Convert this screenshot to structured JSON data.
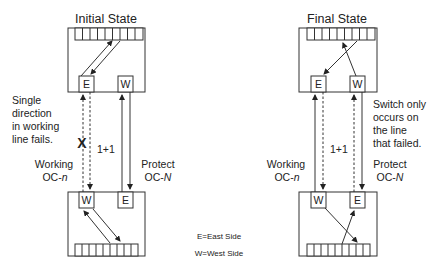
{
  "diagram": {
    "left": {
      "title": "Initial State",
      "top_node": {
        "east_label": "E",
        "west_label": "W"
      },
      "bottom_node": {
        "west_label": "W",
        "east_label": "E"
      },
      "note_lines": [
        "Single",
        "direction",
        "in working",
        "line fails."
      ],
      "failure_mark": "X",
      "scheme_label": "1+1",
      "working_label": {
        "line1": "Working",
        "line2_prefix": "OC-",
        "line2_var": "n"
      },
      "protect_label": {
        "line1": "Protect",
        "line2_prefix": "OC-",
        "line2_var": "N"
      }
    },
    "right": {
      "title": "Final State",
      "top_node": {
        "east_label": "E",
        "west_label": "W"
      },
      "bottom_node": {
        "west_label": "W",
        "east_label": "E"
      },
      "note_lines": [
        "Switch only",
        "occurs on",
        "the line",
        "that failed."
      ],
      "scheme_label": "1+1",
      "working_label": {
        "line1": "Working",
        "line2_prefix": "OC-",
        "line2_var": "n"
      },
      "protect_label": {
        "line1": "Protect",
        "line2_prefix": "OC-",
        "line2_var": "N"
      }
    },
    "legend": {
      "east": "E=East Side",
      "west": "W=West Side"
    },
    "register_cells": 9
  }
}
